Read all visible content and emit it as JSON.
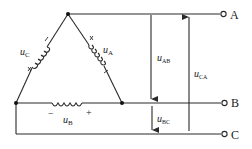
{
  "diagram": {
    "colors": {
      "line": "#2a2a2a",
      "background": "#ffffff"
    },
    "phases": {
      "A": {
        "label_main": "u",
        "label_sub": "A",
        "marks": [
          "×",
          "/"
        ]
      },
      "B": {
        "label_main": "u",
        "label_sub": "B",
        "minus": "−",
        "plus": "+"
      },
      "C": {
        "label_main": "u",
        "label_sub": "C",
        "marks": [
          "/",
          "×"
        ]
      }
    },
    "terminals": [
      {
        "name": "A"
      },
      {
        "name": "B"
      },
      {
        "name": "C"
      }
    ],
    "line_voltages": [
      {
        "main": "u",
        "sub": "AB",
        "direction": "down"
      },
      {
        "main": "u",
        "sub": "BC",
        "direction": "down"
      },
      {
        "main": "u",
        "sub": "CA",
        "direction": "up"
      }
    ]
  }
}
